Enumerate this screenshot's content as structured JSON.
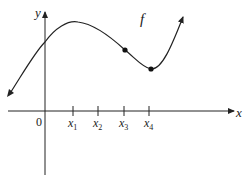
{
  "figure": {
    "function_label": "f",
    "axes": {
      "x_label": "x",
      "y_label": "y",
      "origin_label": "0"
    },
    "ticks": [
      {
        "label": "x",
        "sub": "1"
      },
      {
        "label": "x",
        "sub": "2"
      },
      {
        "label": "x",
        "sub": "3"
      },
      {
        "label": "x",
        "sub": "4"
      }
    ],
    "marked_points": [
      {
        "at": "x3",
        "description": "point on curve above x3 (inflection-like point)"
      },
      {
        "at": "x4",
        "description": "local minimum of f above x4"
      }
    ],
    "colors": {
      "stroke": "#222222",
      "background": "#ffffff"
    }
  }
}
